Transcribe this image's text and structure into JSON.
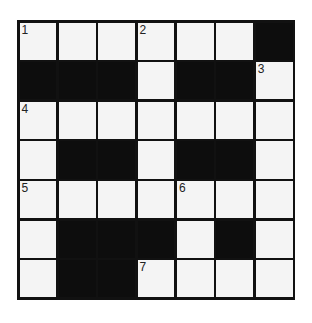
{
  "puzzle": {
    "rows": 7,
    "cols": 7,
    "grid": [
      [
        "W",
        "W",
        "W",
        "W",
        "W",
        "W",
        "B"
      ],
      [
        "B",
        "B",
        "B",
        "W",
        "B",
        "B",
        "W"
      ],
      [
        "W",
        "W",
        "W",
        "W",
        "W",
        "W",
        "W"
      ],
      [
        "W",
        "B",
        "B",
        "W",
        "B",
        "B",
        "W"
      ],
      [
        "W",
        "W",
        "W",
        "W",
        "W",
        "W",
        "W"
      ],
      [
        "W",
        "B",
        "B",
        "B",
        "W",
        "B",
        "W"
      ],
      [
        "W",
        "B",
        "B",
        "W",
        "W",
        "W",
        "W"
      ]
    ],
    "numbers": [
      {
        "row": 0,
        "col": 0,
        "label": "1"
      },
      {
        "row": 0,
        "col": 3,
        "label": "2"
      },
      {
        "row": 1,
        "col": 6,
        "label": "3"
      },
      {
        "row": 2,
        "col": 0,
        "label": "4"
      },
      {
        "row": 4,
        "col": 0,
        "label": "5"
      },
      {
        "row": 4,
        "col": 4,
        "label": "6"
      },
      {
        "row": 6,
        "col": 3,
        "label": "7"
      }
    ],
    "colors": {
      "black": "#0d0d0d",
      "white": "#f4f4f4",
      "line": "#111111"
    }
  }
}
